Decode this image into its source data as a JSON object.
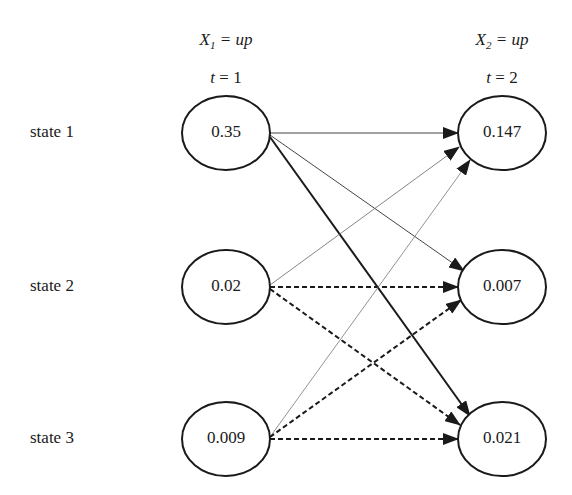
{
  "columns": [
    {
      "var": "X",
      "sub": "1",
      "value_text": "= up",
      "time_var": "t",
      "time_text": "= 1"
    },
    {
      "var": "X",
      "sub": "2",
      "value_text": "= up",
      "time_var": "t",
      "time_text": "= 2"
    }
  ],
  "states": [
    {
      "label": "state 1",
      "t1": "0.35",
      "t2": "0.147"
    },
    {
      "label": "state 2",
      "t1": "0.02",
      "t2": "0.007"
    },
    {
      "label": "state 3",
      "t1": "0.009",
      "t2": "0.021"
    }
  ],
  "edges": [
    {
      "from": "state 1",
      "to": "state 1",
      "style": "thin-solid"
    },
    {
      "from": "state 1",
      "to": "state 2",
      "style": "thin-solid"
    },
    {
      "from": "state 1",
      "to": "state 3",
      "style": "thick-solid"
    },
    {
      "from": "state 2",
      "to": "state 1",
      "style": "thin-solid"
    },
    {
      "from": "state 2",
      "to": "state 2",
      "style": "dashed"
    },
    {
      "from": "state 2",
      "to": "state 3",
      "style": "dashed"
    },
    {
      "from": "state 3",
      "to": "state 1",
      "style": "thin-solid"
    },
    {
      "from": "state 3",
      "to": "state 2",
      "style": "dashed"
    },
    {
      "from": "state 3",
      "to": "state 3",
      "style": "dashed"
    }
  ],
  "colors": {
    "stroke": "#1a1a1a",
    "thin": "#555555",
    "background": "#ffffff"
  }
}
